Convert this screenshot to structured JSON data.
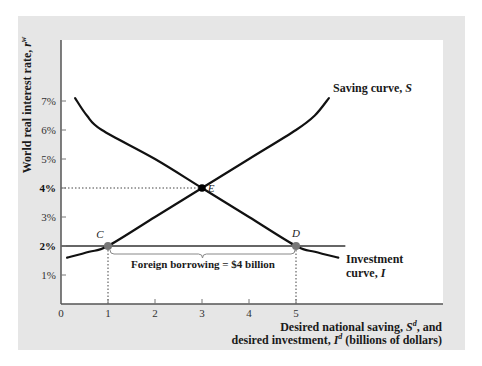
{
  "chart_data": {
    "type": "line",
    "title": "",
    "xlabel_line1_prefix": "Desired national saving, ",
    "xlabel_line1_var": "S",
    "xlabel_line1_sup": "d",
    "xlabel_line1_suffix": ", and",
    "xlabel_line2_prefix": "desired investment, ",
    "xlabel_line2_var": "I",
    "xlabel_line2_sup": "d",
    "xlabel_line2_suffix": " (billions of dollars)",
    "ylabel_prefix": "World real interest rate, ",
    "ylabel_var": "r",
    "ylabel_sup": "w",
    "xlim": [
      0,
      8
    ],
    "ylim": [
      0,
      8
    ],
    "x_ticks": [
      0,
      1,
      2,
      3,
      4,
      5
    ],
    "x_tick_labels": [
      "0",
      "1",
      "2",
      "3",
      "4",
      "5"
    ],
    "y_ticks": [
      1,
      2,
      3,
      4,
      5,
      6,
      7
    ],
    "y_tick_labels": [
      "1%",
      "2%",
      "3%",
      "4%",
      "5%",
      "6%",
      "7%"
    ],
    "y_tick_bold": [
      "2%",
      "4%"
    ],
    "grid": false,
    "series": [
      {
        "name": "Saving curve, S",
        "label_prefix": "Saving curve, ",
        "label_var": "S",
        "points": [
          [
            0.13,
            1.6
          ],
          [
            0.6,
            1.8
          ],
          [
            1,
            2
          ],
          [
            2,
            3
          ],
          [
            3,
            4
          ],
          [
            4,
            5
          ],
          [
            5,
            6
          ],
          [
            5.4,
            6.5
          ],
          [
            5.7,
            7.1
          ]
        ]
      },
      {
        "name": "Investment curve, I",
        "label_line1": "Investment",
        "label_line2_prefix": "curve, ",
        "label_line2_var": "I",
        "points": [
          [
            0.3,
            7.1
          ],
          [
            0.55,
            6.5
          ],
          [
            0.87,
            6.0
          ],
          [
            2,
            5.0
          ],
          [
            3,
            4
          ],
          [
            4,
            3
          ],
          [
            5,
            2
          ],
          [
            5.4,
            1.8
          ],
          [
            5.9,
            1.6
          ]
        ]
      }
    ],
    "horizontal_line": {
      "y": 2,
      "x_from": 0,
      "x_to": 6.05,
      "label": "World real interest rate 2%"
    },
    "points": [
      {
        "label": "C",
        "x": 1,
        "y": 2,
        "color": "#777777"
      },
      {
        "label": "D",
        "x": 5,
        "y": 2,
        "color": "#777777"
      },
      {
        "label": "E",
        "x": 3,
        "y": 4,
        "color": "#000000"
      }
    ],
    "dotted_guides": [
      {
        "type": "horizontal",
        "y": 4,
        "x_from": 0,
        "x_to": 3
      },
      {
        "type": "vertical",
        "x": 1,
        "y_from": 0,
        "y_to": 2
      },
      {
        "type": "vertical",
        "x": 5,
        "y_from": 0,
        "y_to": 2
      }
    ],
    "annotations": [
      {
        "text": "Foreign borrowing = $4 billion",
        "x_from": 1,
        "x_to": 5,
        "y": 2
      }
    ]
  },
  "colors": {
    "frame_bg": "#e6e6e6",
    "plot_bg": "#ffffff",
    "axis": "#555555",
    "curve": "#111111",
    "point_gray": "#777777",
    "point_black": "#000000"
  }
}
